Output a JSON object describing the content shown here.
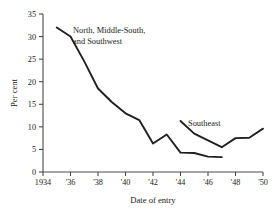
{
  "chart_data": {
    "type": "line",
    "title": "",
    "xlabel": "Date of entry",
    "ylabel": "Per cent",
    "xlim": [
      1934,
      1950
    ],
    "ylim": [
      0,
      35
    ],
    "grid": false,
    "legend_position": "inline-annotation",
    "x_tick_labels": [
      "1934",
      "'36",
      "'38",
      "'40",
      "'42",
      "'44",
      "'46",
      "'48",
      "'50"
    ],
    "x_tick_values": [
      1934,
      1936,
      1938,
      1940,
      1942,
      1944,
      1946,
      1948,
      1950
    ],
    "y_tick_labels": [
      "0",
      "5",
      "10",
      "15",
      "20",
      "25",
      "30",
      "35"
    ],
    "y_tick_values": [
      0,
      5,
      10,
      15,
      20,
      25,
      30,
      35
    ],
    "series": [
      {
        "name": "North, Middle-South, and Southwest",
        "label_line1": "North, Middle-South,",
        "label_line2": "and Southwest",
        "color": "#231f1e",
        "x": [
          1935,
          1936,
          1937,
          1938,
          1939,
          1940,
          1941,
          1942,
          1943,
          1944,
          1945,
          1946,
          1947
        ],
        "values": [
          32.0,
          30.0,
          24.5,
          18.5,
          15.5,
          13.0,
          11.5,
          6.3,
          8.3,
          4.3,
          4.2,
          3.4,
          3.3
        ]
      },
      {
        "name": "Southeast",
        "label_line1": "Southeast",
        "color": "#231f1e",
        "x": [
          1944,
          1945,
          1946,
          1947,
          1948,
          1949,
          1950
        ],
        "values": [
          11.3,
          8.5,
          7.0,
          5.5,
          7.5,
          7.6,
          9.6
        ]
      }
    ]
  },
  "annotations": {
    "series1_label_line1": "North, Middle-South,",
    "series1_label_line2": "and Southwest",
    "series2_label": "Southeast"
  },
  "axes": {
    "x_title": "Date of entry",
    "y_title": "Per cent"
  },
  "colors": {
    "line": "#231f1e",
    "axis": "#4a4a4a",
    "background": "#ffffff"
  }
}
